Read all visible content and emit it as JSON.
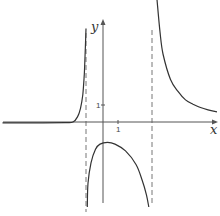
{
  "chart_data": {
    "type": "line",
    "title": "",
    "xlabel": "x",
    "ylabel": "y",
    "tick_labels": {
      "x": [
        "1"
      ],
      "y": [
        "1"
      ]
    },
    "grid": false,
    "legend": null,
    "asymptotes": {
      "vertical": [
        -1.1,
        3.3
      ],
      "horizontal": [
        0
      ]
    },
    "xlim": [
      -6.7,
      7.6
    ],
    "ylim": [
      -4.8,
      6.4
    ],
    "series": [
      {
        "name": "left-branch",
        "points": [
          [
            -6.7,
            -0.05
          ],
          [
            -4.0,
            -0.05
          ],
          [
            -2.5,
            -0.04
          ],
          [
            -2.0,
            0.0
          ],
          [
            -1.7,
            0.3
          ],
          [
            -1.5,
            0.8
          ],
          [
            -1.35,
            1.6
          ],
          [
            -1.25,
            2.8
          ],
          [
            -1.18,
            4.3
          ],
          [
            -1.13,
            5.5
          ]
        ]
      },
      {
        "name": "middle-branch",
        "points": [
          [
            -1.05,
            -5.0
          ],
          [
            -1.0,
            -3.6
          ],
          [
            -0.8,
            -2.4
          ],
          [
            -0.5,
            -1.6
          ],
          [
            -0.2,
            -1.3
          ],
          [
            0.3,
            -1.2
          ],
          [
            0.8,
            -1.3
          ],
          [
            1.5,
            -1.7
          ],
          [
            2.2,
            -2.5
          ],
          [
            2.6,
            -3.4
          ],
          [
            2.9,
            -4.3
          ],
          [
            3.05,
            -5.0
          ]
        ]
      },
      {
        "name": "right-branch",
        "points": [
          [
            3.6,
            7.2
          ],
          [
            3.8,
            5.3
          ],
          [
            4.0,
            4.0
          ],
          [
            4.5,
            2.5
          ],
          [
            5.0,
            1.8
          ],
          [
            5.5,
            1.3
          ],
          [
            6.0,
            1.05
          ],
          [
            6.5,
            0.85
          ],
          [
            7.0,
            0.72
          ],
          [
            7.6,
            0.6
          ]
        ]
      }
    ]
  },
  "axes": {
    "x_label": "x",
    "y_label": "y",
    "x_tick": "1",
    "y_tick": "1"
  }
}
